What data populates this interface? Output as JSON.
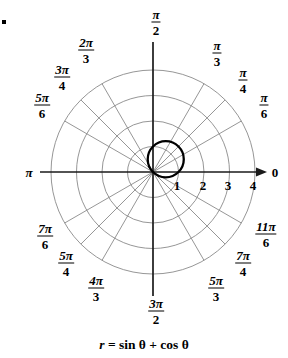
{
  "figure": {
    "caption_parts": {
      "r": "r",
      "equals": "=",
      "expr": "sin θ + cos θ"
    },
    "caption_text": "r = sin θ + cos θ",
    "corner_marker": "▪"
  },
  "colors": {
    "background": "#ffffff",
    "axis": "#1a1a1a",
    "grid": "#8a8a8a",
    "curve": "#000000",
    "text": "#000000"
  },
  "chart_data": {
    "type": "line",
    "coordinate_system": "polar",
    "title": "r = sin θ + cos θ",
    "equation": "r = sin θ + cos θ",
    "xlabel": "",
    "ylabel": "",
    "grid": true,
    "legend": "none",
    "radial_axis": {
      "label": "r",
      "ticks": [
        1,
        2,
        3,
        4
      ],
      "tick_labels": [
        "1",
        "2",
        "3",
        "4"
      ],
      "rlim": [
        0,
        4
      ],
      "ring_radii": [
        1,
        2,
        3,
        4
      ]
    },
    "angular_axis": {
      "label": "θ",
      "direction": "counterclockwise",
      "tick_labels": [
        "0",
        "π/6",
        "π/4",
        "π/3",
        "π/2",
        "2π/3",
        "3π/4",
        "5π/6",
        "π",
        "7π/6",
        "5π/4",
        "4π/3",
        "3π/2",
        "5π/3",
        "7π/4",
        "11π/6"
      ],
      "tick_values_deg": [
        0,
        30,
        45,
        60,
        90,
        120,
        135,
        150,
        180,
        210,
        225,
        240,
        270,
        300,
        315,
        330
      ]
    },
    "series": [
      {
        "name": "r = sin θ + cos θ",
        "description": "Circle of radius √2/2 centered at rectangular point (0.5, 0.5); passes through the pole.",
        "theta_deg": [
          -45,
          -30,
          -15,
          0,
          15,
          30,
          45,
          60,
          75,
          90,
          105,
          120,
          135
        ],
        "r": [
          0,
          0.366,
          0.707,
          1.0,
          1.225,
          1.366,
          1.414,
          1.366,
          1.225,
          1.0,
          0.707,
          0.366,
          0
        ],
        "max_r": 1.414,
        "max_r_at_theta_deg": 45
      }
    ]
  },
  "angle_labels": [
    {
      "name": "angle-0",
      "text": "0",
      "kind": "plain",
      "num": "0",
      "den": "",
      "x": 275,
      "y": 172
    },
    {
      "name": "angle-pi-6",
      "text": "π/6",
      "kind": "fraction",
      "num": "π",
      "den": "6",
      "x": 264,
      "y": 105
    },
    {
      "name": "angle-pi-4",
      "text": "π/4",
      "kind": "fraction",
      "num": "π",
      "den": "4",
      "x": 243,
      "y": 80
    },
    {
      "name": "angle-pi-3",
      "text": "π/3",
      "kind": "fraction",
      "num": "π",
      "den": "3",
      "x": 217,
      "y": 53
    },
    {
      "name": "angle-pi-2",
      "text": "π/2",
      "kind": "fraction",
      "num": "π",
      "den": "2",
      "x": 156,
      "y": 22
    },
    {
      "name": "angle-2pi-3",
      "text": "2π/3",
      "kind": "fraction",
      "num": "2π",
      "den": "3",
      "x": 86,
      "y": 50
    },
    {
      "name": "angle-3pi-4",
      "text": "3π/4",
      "kind": "fraction",
      "num": "3π",
      "den": "4",
      "x": 62,
      "y": 77
    },
    {
      "name": "angle-5pi-6",
      "text": "5π/6",
      "kind": "fraction",
      "num": "5π",
      "den": "6",
      "x": 42,
      "y": 105
    },
    {
      "name": "angle-pi",
      "text": "π",
      "kind": "plain",
      "num": "π",
      "den": "",
      "x": 29,
      "y": 172
    },
    {
      "name": "angle-7pi-6",
      "text": "7π/6",
      "kind": "fraction",
      "num": "7π",
      "den": "6",
      "x": 45,
      "y": 236
    },
    {
      "name": "angle-5pi-4",
      "text": "5π/4",
      "kind": "fraction",
      "num": "5π",
      "den": "4",
      "x": 66,
      "y": 263
    },
    {
      "name": "angle-4pi-3",
      "text": "4π/3",
      "kind": "fraction",
      "num": "4π",
      "den": "3",
      "x": 96,
      "y": 288
    },
    {
      "name": "angle-3pi-2",
      "text": "3π/2",
      "kind": "fraction",
      "num": "3π",
      "den": "2",
      "x": 156,
      "y": 311
    },
    {
      "name": "angle-5pi-3",
      "text": "5π/3",
      "kind": "fraction",
      "num": "5π",
      "den": "3",
      "x": 216,
      "y": 288
    },
    {
      "name": "angle-7pi-4",
      "text": "7π/4",
      "kind": "fraction",
      "num": "7π",
      "den": "4",
      "x": 243,
      "y": 263
    },
    {
      "name": "angle-11pi-6",
      "text": "11π/6",
      "kind": "fraction",
      "num": "11π",
      "den": "6",
      "x": 266,
      "y": 234
    }
  ],
  "radial_ticks": [
    {
      "name": "radial-tick-1",
      "label": "1",
      "x": 177,
      "y": 178
    },
    {
      "name": "radial-tick-2",
      "label": "2",
      "x": 203,
      "y": 178
    },
    {
      "name": "radial-tick-3",
      "label": "3",
      "x": 228,
      "y": 178
    },
    {
      "name": "radial-tick-4",
      "label": "4",
      "x": 253,
      "y": 178
    }
  ],
  "geometry": {
    "center_x": 153,
    "center_y": 172,
    "unit_px": 25.5,
    "max_units": 4
  }
}
